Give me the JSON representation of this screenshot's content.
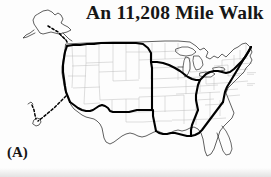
{
  "figure": {
    "title": "An 11,208 Mile Walk",
    "panel_label": "(A)",
    "caption_text": "",
    "background_color": "#ffffff",
    "ink_color": "#000000",
    "state_border_color": "#b9b9b9",
    "route_color": "#000000",
    "width": 271,
    "height": 177
  },
  "map": {
    "type": "united-states-outline",
    "description": "Outline map of the contiguous United States with light state boundaries, an Alaska inset at upper left and a small Hawaii inset at lower left. A heavy black line traces a walking route.",
    "route": {
      "name": "walk-route",
      "total_miles": "11,208",
      "style": "solid-heavy-black",
      "connector_style": "dashed"
    },
    "insets": [
      {
        "name": "alaska-inset",
        "label": ""
      },
      {
        "name": "hawaii-inset",
        "label": ""
      }
    ],
    "city_labels": [
      {
        "name": "east-coast-label-upper",
        "text": ""
      },
      {
        "name": "east-coast-label-lower",
        "text": ""
      }
    ]
  }
}
